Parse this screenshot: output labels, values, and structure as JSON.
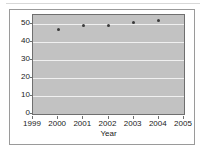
{
  "chart_data": {
    "type": "scatter",
    "title": "",
    "xlabel": "Year",
    "ylabel": "",
    "x": [
      2000,
      2001,
      2002,
      2003,
      2004
    ],
    "values": [
      47,
      49,
      49,
      51,
      52
    ],
    "series": [
      {
        "name": "series-1",
        "values": [
          47,
          49,
          49,
          51,
          52
        ]
      }
    ],
    "xlim": [
      1999,
      2005
    ],
    "ylim": [
      0,
      55
    ],
    "xticks": [
      "1999",
      "2000",
      "2001",
      "2002",
      "2003",
      "2004",
      "2005"
    ],
    "xtick_values": [
      1999,
      2000,
      2001,
      2002,
      2003,
      2004,
      2005
    ],
    "yticks": [
      "0",
      "10",
      "20",
      "30",
      "40",
      "50"
    ],
    "ytick_values": [
      0,
      10,
      20,
      30,
      40,
      50
    ],
    "gridlines": true,
    "grid_axis": "y",
    "legend": false,
    "plot_background": "#c2c2c2",
    "gridline_color": "#f0f0f0",
    "marker_color": "#3a3a3a",
    "axis_color": "#6f6f6f"
  }
}
